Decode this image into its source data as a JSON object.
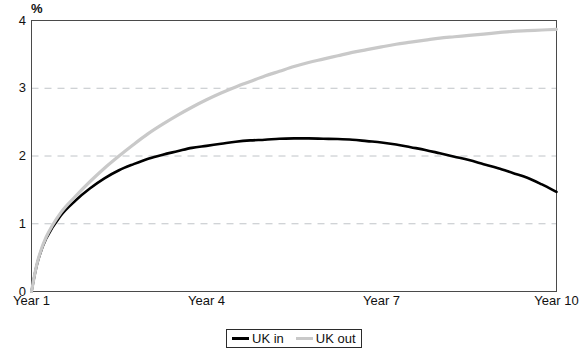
{
  "chart_data": {
    "type": "line",
    "title": "",
    "subtitle": "",
    "xlabel": "",
    "ylabel": "%",
    "ylim": [
      0,
      4
    ],
    "yticks": [
      0,
      1,
      2,
      3,
      4
    ],
    "ytick_labels": [
      "0",
      "1",
      "2",
      "3",
      "4"
    ],
    "xlim": [
      1,
      10
    ],
    "xticks": [
      1,
      4,
      7,
      10
    ],
    "xtick_labels": [
      "Year 1",
      "Year 4",
      "Year 7",
      "Year 10"
    ],
    "grid": "horizontal-dashed",
    "legend_position": "bottom-center",
    "x": [
      1,
      1.1,
      1.25,
      1.5,
      1.75,
      2,
      2.25,
      2.5,
      2.75,
      3,
      3.25,
      3.5,
      3.75,
      4,
      4.25,
      4.5,
      4.75,
      5,
      5.25,
      5.5,
      5.75,
      6,
      6.25,
      6.5,
      6.75,
      7,
      7.25,
      7.5,
      7.75,
      8,
      8.25,
      8.5,
      8.75,
      9,
      9.25,
      9.5,
      9.75,
      10
    ],
    "series": [
      {
        "name": "UK in",
        "color": "#000000",
        "style": "solid",
        "values": [
          0,
          0.42,
          0.78,
          1.12,
          1.34,
          1.52,
          1.67,
          1.79,
          1.88,
          1.96,
          2.02,
          2.07,
          2.12,
          2.15,
          2.18,
          2.21,
          2.23,
          2.24,
          2.255,
          2.26,
          2.26,
          2.255,
          2.25,
          2.24,
          2.22,
          2.2,
          2.17,
          2.13,
          2.09,
          2.04,
          1.99,
          1.94,
          1.88,
          1.82,
          1.75,
          1.68,
          1.58,
          1.47
        ]
      },
      {
        "name": "UK out",
        "color": "#c9c9c9",
        "style": "solid",
        "values": [
          0,
          0.43,
          0.8,
          1.16,
          1.4,
          1.62,
          1.82,
          2.0,
          2.17,
          2.33,
          2.47,
          2.6,
          2.72,
          2.83,
          2.93,
          3.02,
          3.1,
          3.18,
          3.25,
          3.32,
          3.38,
          3.43,
          3.48,
          3.53,
          3.57,
          3.61,
          3.65,
          3.68,
          3.71,
          3.74,
          3.76,
          3.78,
          3.8,
          3.82,
          3.84,
          3.85,
          3.86,
          3.87
        ]
      }
    ],
    "legend": [
      {
        "label": "UK in",
        "color": "#000000"
      },
      {
        "label": "UK out",
        "color": "#c9c9c9"
      }
    ]
  },
  "axes": {
    "y_unit_label": "%"
  }
}
